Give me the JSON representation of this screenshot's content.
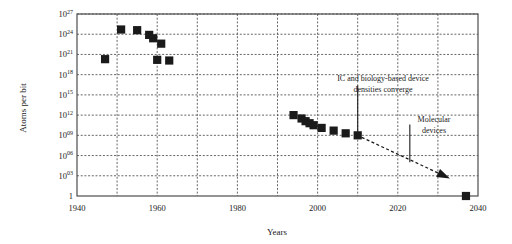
{
  "chart_data": {
    "type": "scatter",
    "title": "",
    "xlabel": "Years",
    "ylabel": "Atoms per bit",
    "xlim": [
      1940,
      2040
    ],
    "ylim": [
      0,
      27
    ],
    "y_scale": "log10",
    "grid": true,
    "legend": null,
    "x_ticks": [
      "1940",
      "1960",
      "1980",
      "2000",
      "2020",
      "2040"
    ],
    "x_tick_values": [
      1940,
      1960,
      1980,
      2000,
      2020,
      2040
    ],
    "x_minor_tick_values": [
      1950,
      1970,
      1990,
      2010,
      2030
    ],
    "y_ticks": [
      "1",
      "10³",
      "10⁰⁶",
      "10⁰⁹",
      "10¹²",
      "10¹⁵",
      "10¹⁸",
      "10²¹",
      "10²⁴",
      "10²⁷"
    ],
    "y_tick_mantissa": [
      "1",
      "10",
      "10",
      "10",
      "10",
      "10",
      "10",
      "10",
      "10",
      "10"
    ],
    "y_tick_exponent": [
      "",
      "03",
      "06",
      "09",
      "12",
      "15",
      "18",
      "21",
      "24",
      "27"
    ],
    "y_tick_values": [
      0,
      3,
      6,
      9,
      12,
      15,
      18,
      21,
      24,
      27
    ],
    "marker": "filled-square",
    "marker_color": "#1a1a1a",
    "points": [
      {
        "x": 1947,
        "y": 20.3
      },
      {
        "x": 1951,
        "y": 24.7
      },
      {
        "x": 1955,
        "y": 24.6
      },
      {
        "x": 1958,
        "y": 23.9
      },
      {
        "x": 1959,
        "y": 23.4
      },
      {
        "x": 1960,
        "y": 20.2
      },
      {
        "x": 1961,
        "y": 22.6
      },
      {
        "x": 1963,
        "y": 20.1
      },
      {
        "x": 1994,
        "y": 12.0
      },
      {
        "x": 1996,
        "y": 11.5
      },
      {
        "x": 1997,
        "y": 11.1
      },
      {
        "x": 1998,
        "y": 10.8
      },
      {
        "x": 1999,
        "y": 10.5
      },
      {
        "x": 2001,
        "y": 10.1
      },
      {
        "x": 2004,
        "y": 9.7
      },
      {
        "x": 2007,
        "y": 9.3
      },
      {
        "x": 2010,
        "y": 9.0
      },
      {
        "x": 2037,
        "y": 0.0
      }
    ],
    "trend_arrow": {
      "style": "dashed",
      "from": {
        "x": 2011,
        "y": 8.7
      },
      "to": {
        "x": 2033,
        "y": 2.6
      },
      "arrowhead": "filled-triangle"
    },
    "annotations": [
      {
        "id": "converge-note",
        "lines": [
          "IC and biology-based device",
          "densities converge"
        ],
        "text": "IC and biology-based device densities converge",
        "leader_line": {
          "x": 2010,
          "y_top": 16.4,
          "y_bottom": 9.2
        }
      },
      {
        "id": "molecular-note",
        "lines": [
          "Molecular",
          "devices"
        ],
        "text": "Molecular devices",
        "leader_line": {
          "x": 2023,
          "y_top": 10.6,
          "y_bottom": 5.0
        }
      }
    ]
  },
  "figure": {
    "y_axis_title": "Atoms per bit",
    "x_axis_title": "Years"
  }
}
